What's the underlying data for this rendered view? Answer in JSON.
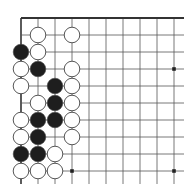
{
  "board": {
    "description": "Top-left corner of a Go board",
    "origin": {
      "x": 21,
      "y": 18
    },
    "spacing": 17,
    "cols": 10,
    "rows": 10,
    "line_extend_right": 184,
    "line_extend_bottom": 184,
    "colors": {
      "line": "#555555",
      "edge": "#333333",
      "black_stone": "#1e1e1e",
      "white_stone": "#ffffff",
      "stone_outline": "#444444",
      "background": "#ffffff"
    },
    "star_points": [
      {
        "col": 3,
        "row": 9
      },
      {
        "col": 9,
        "row": 3
      },
      {
        "col": 9,
        "row": 9
      }
    ],
    "stones": [
      {
        "col": 1,
        "row": 1,
        "color": "white"
      },
      {
        "col": 3,
        "row": 1,
        "color": "white"
      },
      {
        "col": 0,
        "row": 2,
        "color": "black"
      },
      {
        "col": 1,
        "row": 2,
        "color": "white"
      },
      {
        "col": 0,
        "row": 3,
        "color": "white"
      },
      {
        "col": 1,
        "row": 3,
        "color": "black"
      },
      {
        "col": 3,
        "row": 3,
        "color": "white"
      },
      {
        "col": 0,
        "row": 4,
        "color": "white"
      },
      {
        "col": 2,
        "row": 4,
        "color": "black"
      },
      {
        "col": 3,
        "row": 4,
        "color": "white"
      },
      {
        "col": 1,
        "row": 5,
        "color": "white"
      },
      {
        "col": 2,
        "row": 5,
        "color": "black"
      },
      {
        "col": 3,
        "row": 5,
        "color": "white"
      },
      {
        "col": 0,
        "row": 6,
        "color": "white"
      },
      {
        "col": 1,
        "row": 6,
        "color": "black"
      },
      {
        "col": 2,
        "row": 6,
        "color": "black"
      },
      {
        "col": 3,
        "row": 6,
        "color": "white"
      },
      {
        "col": 0,
        "row": 7,
        "color": "white"
      },
      {
        "col": 1,
        "row": 7,
        "color": "black"
      },
      {
        "col": 3,
        "row": 7,
        "color": "white"
      },
      {
        "col": 0,
        "row": 8,
        "color": "black"
      },
      {
        "col": 1,
        "row": 8,
        "color": "black"
      },
      {
        "col": 2,
        "row": 8,
        "color": "white"
      },
      {
        "col": 0,
        "row": 9,
        "color": "white"
      },
      {
        "col": 1,
        "row": 9,
        "color": "white"
      },
      {
        "col": 2,
        "row": 9,
        "color": "white"
      }
    ]
  }
}
